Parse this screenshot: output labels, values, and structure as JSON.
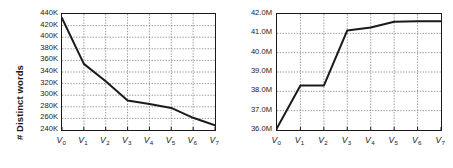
{
  "figure": {
    "panels": [
      "left",
      "right"
    ],
    "background_color": "#ffffff",
    "line_color": "#1a1a1a",
    "grid_color": "#808080",
    "axis_color": "#1a1a1a"
  },
  "left_panel": {
    "ylabel": "# Distinct words",
    "yticks": [
      "240K",
      "260K",
      "280K",
      "300K",
      "320K",
      "340K",
      "360K",
      "380K",
      "400K",
      "420K",
      "440K"
    ],
    "xticks": [
      "V",
      "V",
      "V",
      "V",
      "V",
      "V",
      "V",
      "V"
    ],
    "xtick_subs": [
      "0",
      "1",
      "2",
      "3",
      "4",
      "5",
      "6",
      "7"
    ]
  },
  "right_panel": {
    "ylabel": "# Words",
    "yticks": [
      "36.0M",
      "37.0M",
      "38.0M",
      "39.0M",
      "40.0M",
      "41.0M",
      "42.0M"
    ],
    "xticks": [
      "V",
      "V",
      "V",
      "V",
      "V",
      "V",
      "V",
      "V"
    ],
    "xtick_subs": [
      "0",
      "1",
      "2",
      "3",
      "4",
      "5",
      "6",
      "7"
    ]
  },
  "chart_data": [
    {
      "type": "line",
      "panel": "left",
      "title": "",
      "xlabel": "",
      "ylabel": "# Distinct words",
      "categories": [
        "V0",
        "V1",
        "V2",
        "V3",
        "V4",
        "V5",
        "V6",
        "V7"
      ],
      "x": [
        0,
        1,
        2,
        3,
        4,
        5,
        6,
        7
      ],
      "values": [
        433000,
        354000,
        324000,
        291000,
        285000,
        278000,
        261000,
        248000
      ],
      "ytick_values": [
        240000,
        260000,
        280000,
        300000,
        320000,
        340000,
        360000,
        380000,
        400000,
        420000,
        440000
      ],
      "ytick_labels": [
        "240K",
        "260K",
        "280K",
        "300K",
        "320K",
        "340K",
        "360K",
        "380K",
        "400K",
        "420K",
        "440K"
      ],
      "xtick_labels": [
        "V0",
        "V1",
        "V2",
        "V3",
        "V4",
        "V5",
        "V6",
        "V7"
      ],
      "ylim": [
        240000,
        440000
      ],
      "xlim": [
        0,
        7
      ],
      "grid": true,
      "grid_style": "dotted",
      "legend": null,
      "markers": false
    },
    {
      "type": "line",
      "panel": "right",
      "title": "",
      "xlabel": "",
      "ylabel": "# Words",
      "categories": [
        "V0",
        "V1",
        "V2",
        "V3",
        "V4",
        "V5",
        "V6",
        "V7"
      ],
      "x": [
        0,
        1,
        2,
        3,
        4,
        5,
        6,
        7
      ],
      "values": [
        36100000,
        38300000,
        38300000,
        41150000,
        41300000,
        41600000,
        41620000,
        41620000
      ],
      "ytick_values": [
        36000000,
        37000000,
        38000000,
        39000000,
        40000000,
        41000000,
        42000000
      ],
      "ytick_labels": [
        "36.0M",
        "37.0M",
        "38.0M",
        "39.0M",
        "40.0M",
        "41.0M",
        "42.0M"
      ],
      "xtick_labels": [
        "V0",
        "V1",
        "V2",
        "V3",
        "V4",
        "V5",
        "V6",
        "V7"
      ],
      "ylim": [
        36000000,
        42000000
      ],
      "xlim": [
        0,
        7
      ],
      "grid": true,
      "grid_style": "dotted",
      "legend": null,
      "markers": false
    }
  ]
}
